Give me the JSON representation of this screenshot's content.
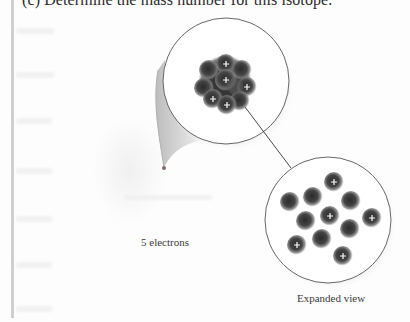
{
  "question": {
    "text": "(c) Determine the mass number for this isotope."
  },
  "figure": {
    "electrons_label": "5 electrons",
    "expanded_label": "Expanded view",
    "nucleus": {
      "protons": 5,
      "neutrons": 6,
      "proton_symbol": "+"
    },
    "colors": {
      "particle": "#3c3c3c",
      "circle_stroke": "#555555",
      "connector": "#333333",
      "electron_dot": "#8a6a6a"
    }
  }
}
